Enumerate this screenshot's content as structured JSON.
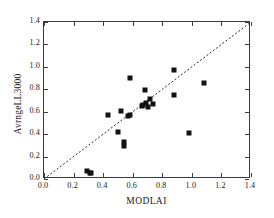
{
  "chart_data": {
    "type": "scatter",
    "title": "",
    "xlabel": "MODLAI",
    "ylabel": "AvrngeLL3000",
    "xlim": [
      0.0,
      1.4
    ],
    "ylim": [
      0.0,
      1.4
    ],
    "xticks": [
      "0.0",
      "0.2",
      "0.4",
      "0.6",
      "0.8",
      "1.0",
      "1.2",
      "1.4"
    ],
    "yticks": [
      "0.0",
      "0.2",
      "0.4",
      "0.6",
      "0.8",
      "1.0",
      "1.2",
      "1.4"
    ],
    "xtick_values": [
      0.0,
      0.2,
      0.4,
      0.6,
      0.8,
      1.0,
      1.2,
      1.4
    ],
    "ytick_values": [
      0.0,
      0.2,
      0.4,
      0.6,
      0.8,
      1.0,
      1.2,
      1.4
    ],
    "grid": false,
    "legend": null,
    "marker": "square",
    "marker_color": "#111111",
    "frame_color": "#3c3c3c",
    "background_color": "#ffffff",
    "reference_line": {
      "name": "1:1 line",
      "style": "dotted",
      "color": "#2b2b2b",
      "from": [
        0.0,
        0.0
      ],
      "to": [
        1.4,
        1.4
      ]
    },
    "series": [
      {
        "name": "sites",
        "points": [
          [
            0.29,
            0.07
          ],
          [
            0.31,
            0.05
          ],
          [
            0.32,
            0.05
          ],
          [
            0.43,
            0.57
          ],
          [
            0.5,
            0.42
          ],
          [
            0.52,
            0.61
          ],
          [
            0.54,
            0.33
          ],
          [
            0.54,
            0.29
          ],
          [
            0.57,
            0.56
          ],
          [
            0.58,
            0.57
          ],
          [
            0.58,
            0.9
          ],
          [
            0.66,
            0.65
          ],
          [
            0.67,
            0.66
          ],
          [
            0.68,
            0.79
          ],
          [
            0.69,
            0.68
          ],
          [
            0.7,
            0.64
          ],
          [
            0.72,
            0.71
          ],
          [
            0.74,
            0.67
          ],
          [
            0.88,
            0.97
          ],
          [
            0.88,
            0.75
          ],
          [
            0.98,
            0.41
          ],
          [
            1.08,
            0.86
          ]
        ]
      }
    ]
  }
}
